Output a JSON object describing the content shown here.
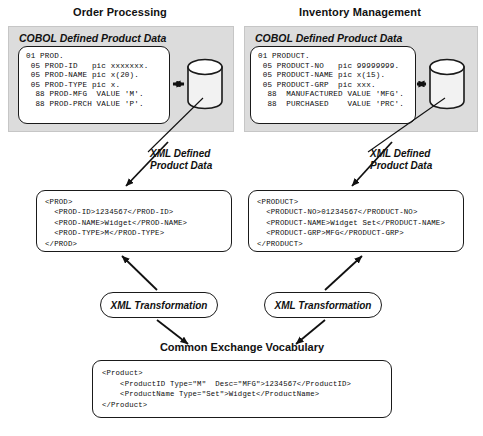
{
  "diagram": {
    "cev_heading": "Common Exchange Vocabulary"
  },
  "sections": [
    {
      "id": "order-processing",
      "title": "Order Processing",
      "panel_label": "COBOL Defined Product Data",
      "cobol_code": "01 PROD.\n 05 PROD-ID   pic xxxxxxx.\n 05 PROD-NAME pic x(20).\n 05 PROD-TYPE pic x.\n  88 PROD-MFG  VALUE 'M'.\n  88 PROD-PRCH VALUE 'P'.",
      "xml_label": "XML Defined\nProduct Data",
      "xml_label_line1": "XML Defined",
      "xml_label_line2": "Product Data",
      "xml_code": "<PROD>\n  <PROD-ID>1234567</PROD-ID>\n  <PROD-NAME>Widget</PROD-NAME>\n  <PROD-TYPE>M</PROD-TYPE>\n</PROD>",
      "transformation_label": "XML Transformation",
      "datastore_icon": "database-cylinder-icon"
    },
    {
      "id": "inventory-management",
      "title": "Inventory Management",
      "panel_label": "COBOL Defined Product Data",
      "cobol_code": "01 PRODUCT.\n 05 PRODUCT-NO   pic 99999999.\n 05 PRODUCT-NAME pic x(15).\n 05 PRODUCT-GRP  pic xxx.\n  88  MANUFACTURED VALUE 'MFG'.\n  88  PURCHASED    VALUE 'PRC'.",
      "xml_label": "XML Defined\nProduct Data",
      "xml_label_line1": "XML Defined",
      "xml_label_line2": "Product Data",
      "xml_code": "<PRODUCT>\n  <PRODUCT-NO>01234567</PRODUCT-NO>\n  <PRODUCT-NAME>Widget Set</PRODUCT-NAME>\n  <PRODUCT-GRP>MFG</PRODUCT-GRP>\n</PRODUCT>",
      "transformation_label": "XML Transformation",
      "datastore_icon": "database-cylinder-icon"
    }
  ],
  "common_exchange": {
    "heading": "Common Exchange Vocabulary",
    "code": "<Product>\n    <ProductID Type=\"M\"  Desc=\"MFG\">1234567</ProductID>\n    <ProductName Type=\"Set\">Widget</ProductName>\n</Product>"
  },
  "colors": {
    "panel_fill": "#dcdcdc",
    "panel_border": "#c6c6c6",
    "box_border": "#1a1a1a",
    "box_fill": "#ffffff",
    "text": "#111111",
    "cylinder_fill": "#f2f2f2",
    "cylinder_shade": "#c9c9c9"
  }
}
